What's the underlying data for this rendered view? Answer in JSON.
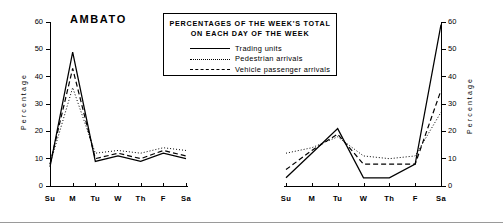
{
  "legend": {
    "title_line1": "PERCENTAGES OF THE WEEK'S TOTAL",
    "title_line2": "ON EACH DAY OF THE WEEK",
    "entries": [
      {
        "label": "Trading units",
        "style": "solid"
      },
      {
        "label": "Pedestrian arrivals",
        "style": "dotted"
      },
      {
        "label": "Vehicle passenger arrivals",
        "style": "dashed"
      }
    ]
  },
  "axis": {
    "ylabel": "Percentage",
    "yticks": [
      "0",
      "10",
      "20",
      "30",
      "40",
      "50",
      "60"
    ],
    "xticks": [
      "Su",
      "M",
      "Tu",
      "W",
      "Th",
      "F",
      "Sa"
    ]
  },
  "chart_data": [
    {
      "type": "line",
      "title": "AMBATO",
      "xlabel": "",
      "ylabel": "Percentage",
      "ylim": [
        0,
        60
      ],
      "ytick_step": 10,
      "grid": false,
      "legend_position": "top-center-shared",
      "categories": [
        "Su",
        "M",
        "Tu",
        "W",
        "Th",
        "F",
        "Sa"
      ],
      "series": [
        {
          "name": "Trading units",
          "style": "solid",
          "values": [
            7,
            49,
            9,
            11,
            9,
            12,
            10
          ]
        },
        {
          "name": "Pedestrian arrivals",
          "style": "dotted",
          "values": [
            8,
            36,
            12,
            13,
            12,
            14,
            13
          ]
        },
        {
          "name": "Vehicle passenger arrivals",
          "style": "dashed",
          "values": [
            8,
            43,
            10,
            12,
            10,
            13,
            11
          ]
        }
      ]
    },
    {
      "type": "line",
      "title": "LATACUNGA",
      "xlabel": "",
      "ylabel": "Percentage",
      "ylim": [
        0,
        60
      ],
      "ytick_step": 10,
      "grid": false,
      "legend_position": "top-center-shared",
      "yaxis_side": "right",
      "categories": [
        "Su",
        "M",
        "Tu",
        "W",
        "Th",
        "F",
        "Sa"
      ],
      "series": [
        {
          "name": "Trading units",
          "style": "solid",
          "values": [
            3,
            12,
            21,
            3,
            3,
            8,
            59
          ]
        },
        {
          "name": "Pedestrian arrivals",
          "style": "dotted",
          "values": [
            12,
            14,
            18,
            11,
            10,
            11,
            27
          ]
        },
        {
          "name": "Vehicle passenger arrivals",
          "style": "dashed",
          "values": [
            6,
            13,
            19,
            8,
            8,
            8,
            35
          ]
        }
      ]
    }
  ]
}
